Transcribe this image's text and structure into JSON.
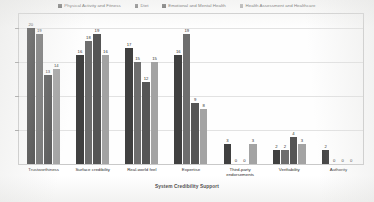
{
  "chart_data": {
    "type": "bar",
    "title": "",
    "xlabel": "System Credibility Support",
    "ylabel": "",
    "ylim": [
      0,
      22
    ],
    "grid": true,
    "legend_position": "top-center",
    "categories": [
      "Trustworthiness",
      "Surface credibility",
      "Real-world feel",
      "Expertise",
      "Third-party endorsements",
      "Verifiability",
      "Authority"
    ],
    "series": [
      {
        "name": "Physical Activity and Fitness",
        "color": "#404040",
        "values": [
          20,
          16,
          17,
          16,
          3,
          2,
          2
        ]
      },
      {
        "name": "Diet",
        "color": "#6e6e6e",
        "values": [
          19,
          18,
          15,
          19,
          0,
          2,
          0
        ]
      },
      {
        "name": "Emotional and Mental Health",
        "color": "#555555",
        "values": [
          13,
          19,
          12,
          9,
          0,
          4,
          0
        ]
      },
      {
        "name": "Health Assessment and Healthcare",
        "color": "#a3a3a3",
        "values": [
          14,
          16,
          15,
          8,
          3,
          3,
          0
        ]
      }
    ]
  },
  "axis": {
    "y_ticks": [
      "",
      "",
      "",
      ""
    ],
    "x_title": "System Credibility Support"
  },
  "colors": {
    "series_1": "#404040",
    "series_2": "#6e6e6e",
    "series_3": "#555555",
    "series_4": "#a3a3a3",
    "grid": "#e2e2e2",
    "frame": "#c9c9c9",
    "text": "#2c2c2c",
    "background": "#ffffff"
  }
}
